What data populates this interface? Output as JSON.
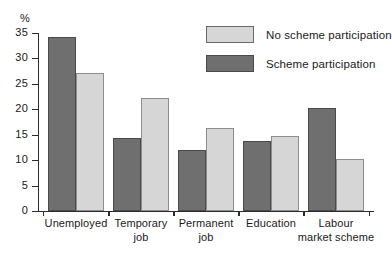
{
  "chart_data": {
    "type": "bar",
    "title": "",
    "xlabel": "",
    "ylabel": "%",
    "ylim": [
      0,
      35
    ],
    "ytick_step": 5,
    "yticks": [
      0,
      5,
      10,
      15,
      20,
      25,
      30,
      35
    ],
    "grid": false,
    "legend_position": "top-right",
    "categories": [
      "Unemployed",
      "Temporary job",
      "Permanent job",
      "Education",
      "Labour market scheme"
    ],
    "category_lines": [
      [
        "Unemployed"
      ],
      [
        "Temporary",
        "job"
      ],
      [
        "Permanent",
        "job"
      ],
      [
        "Education"
      ],
      [
        "Labour",
        "market scheme"
      ]
    ],
    "series": [
      {
        "name": "Scheme participation",
        "color": "#6f6f6f",
        "values": [
          34.2,
          14.4,
          11.9,
          13.7,
          20.3
        ]
      },
      {
        "name": "No scheme participation",
        "color": "#d6d6d6",
        "values": [
          27.2,
          22.3,
          16.4,
          14.8,
          10.3
        ]
      }
    ]
  },
  "legend": {
    "items": [
      {
        "label": "No scheme participation",
        "swatch": "light"
      },
      {
        "label": "Scheme participation",
        "swatch": "dark"
      }
    ]
  }
}
